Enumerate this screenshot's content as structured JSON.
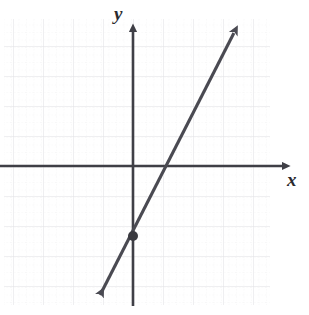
{
  "figure": {
    "name": "coordinate-plane-line-graph",
    "background_color": "#ffffff",
    "axis_color": "#3f3f46",
    "line_color": "#4a4a52",
    "grid_major_color": "#e2e2e6",
    "grid_minor_color": "#dededf",
    "point_color": "#3a3a40"
  },
  "axes": {
    "x_label": "x",
    "y_label": "y",
    "x_axis_pixel_y": 166,
    "y_axis_pixel_x": 133,
    "x_arrow_tip_px": 290,
    "y_arrow_tip_px": 24,
    "grid_major_spacing_px": 30,
    "grid_minor_spacing_px": 7.5,
    "grid_left_px": 4,
    "grid_right_px": 270,
    "grid_top_px": 20,
    "grid_bottom_px": 305
  },
  "chart_data": {
    "type": "line",
    "title": "",
    "xlabel": "x",
    "ylabel": "y",
    "grid": true,
    "legend": "none",
    "xlim": [
      -4.3,
      4.6
    ],
    "ylim": [
      -4.6,
      4.9
    ],
    "series": [
      {
        "name": "line",
        "kind": "linear",
        "slope": 2,
        "y_intercept": -2.33,
        "x_intercept": 1.3,
        "x": [
          -3.1,
          3.5
        ],
        "y": [
          -8.5,
          4.7
        ],
        "arrow_start": true,
        "arrow_end": true,
        "endpoints_px": [
          {
            "x": 96,
            "y": 303
          },
          {
            "x": 238,
            "y": 25
          }
        ]
      }
    ],
    "points": [
      {
        "name": "marked-point",
        "x": 0,
        "y": -2.33,
        "pixel": {
          "x": 133,
          "y": 236
        },
        "label": "",
        "filled": true,
        "radius_px": 5
      }
    ],
    "xticks": [
      -4,
      -3,
      -2,
      -1,
      0,
      1,
      2,
      3,
      4
    ],
    "yticks": [
      -4,
      -3,
      -2,
      -1,
      0,
      1,
      2,
      3,
      4
    ],
    "xticklabels": [],
    "yticklabels": []
  }
}
